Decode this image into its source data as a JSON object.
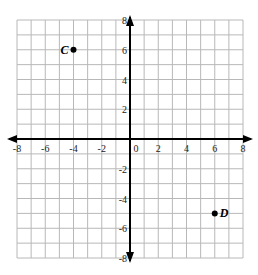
{
  "chart_data": {
    "type": "scatter",
    "title": "",
    "xlabel": "",
    "ylabel": "",
    "xlim": [
      -8,
      8
    ],
    "ylim": [
      -8,
      8
    ],
    "grid": true,
    "x_ticks": [
      "-8",
      "-6",
      "-4",
      "-2",
      "0",
      "2",
      "4",
      "6",
      "8"
    ],
    "y_ticks": [
      "8",
      "6",
      "4",
      "2",
      "-2",
      "-4",
      "-6",
      "-8"
    ],
    "points": [
      {
        "label": "C",
        "x": -4,
        "y": 6
      },
      {
        "label": "D",
        "x": 6,
        "y": -5
      }
    ]
  },
  "colors": {
    "grid": "#b8b8b8",
    "axis": "#000000",
    "point": "#000000"
  }
}
